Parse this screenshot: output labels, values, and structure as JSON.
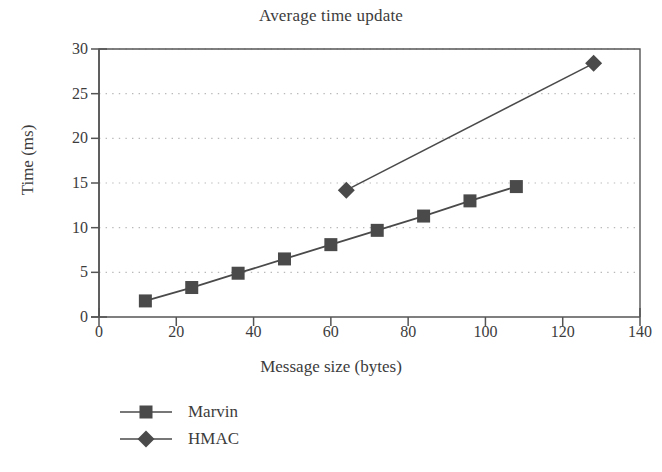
{
  "chart_data": {
    "type": "line",
    "title": "Average time update",
    "xlabel": "Message size (bytes)",
    "ylabel": "Time (ms)",
    "xlim": [
      0,
      140
    ],
    "ylim": [
      0,
      30
    ],
    "xticks": [
      0,
      20,
      40,
      60,
      80,
      100,
      120,
      140
    ],
    "yticks": [
      0,
      5,
      10,
      15,
      20,
      25,
      30
    ],
    "grid": "horizontal-dotted",
    "legend_position": "below-left",
    "series": [
      {
        "name": "Marvin",
        "marker": "square",
        "color": "#4a4a4a",
        "x": [
          12,
          24,
          36,
          48,
          60,
          72,
          84,
          96,
          108
        ],
        "values": [
          1.8,
          3.3,
          4.9,
          6.5,
          8.1,
          9.7,
          11.3,
          13.0,
          14.6
        ]
      },
      {
        "name": "HMAC",
        "marker": "diamond",
        "color": "#4a4a4a",
        "x": [
          64,
          128
        ],
        "values": [
          14.2,
          28.4
        ]
      }
    ]
  },
  "legend": {
    "items": [
      {
        "label": "Marvin",
        "marker": "square"
      },
      {
        "label": "HMAC",
        "marker": "diamond"
      }
    ]
  },
  "colors": {
    "series": "#4a4a4a",
    "axis": "#555555",
    "grid": "#b9b9b9",
    "text": "#3c3c3c",
    "background": "#ffffff"
  }
}
